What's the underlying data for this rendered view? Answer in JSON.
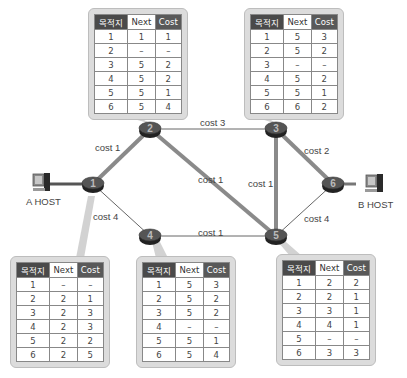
{
  "routers": [
    {
      "id": "1",
      "x": 93,
      "y": 184
    },
    {
      "id": "2",
      "x": 150,
      "y": 129
    },
    {
      "id": "3",
      "x": 276,
      "y": 129
    },
    {
      "id": "4",
      "x": 150,
      "y": 236
    },
    {
      "id": "5",
      "x": 276,
      "y": 236
    },
    {
      "id": "6",
      "x": 333,
      "y": 184
    }
  ],
  "links": [
    {
      "from": "1",
      "to": "2",
      "label": "cost 1",
      "thick": true
    },
    {
      "from": "1",
      "to": "4",
      "label": "cost 4",
      "thick": false
    },
    {
      "from": "2",
      "to": "3",
      "label": "cost 3",
      "thick": false
    },
    {
      "from": "2",
      "to": "5",
      "label": "cost 1",
      "thick": true
    },
    {
      "from": "3",
      "to": "5",
      "label": "cost 1",
      "thick": true
    },
    {
      "from": "3",
      "to": "6",
      "label": "cost 2",
      "thick": true
    },
    {
      "from": "4",
      "to": "5",
      "label": "cost 1",
      "thick": false
    },
    {
      "from": "5",
      "to": "6",
      "label": "cost 4",
      "thick": false
    }
  ],
  "hosts": {
    "a": {
      "label": "A HOST"
    },
    "b": {
      "label": "B HOST"
    }
  },
  "table_headers": {
    "dest": "목적지",
    "next": "Next",
    "cost": "Cost"
  },
  "tables": {
    "r1": {
      "rows": [
        [
          "1",
          "–",
          "–"
        ],
        [
          "2",
          "2",
          "1"
        ],
        [
          "3",
          "2",
          "3"
        ],
        [
          "4",
          "2",
          "3"
        ],
        [
          "5",
          "2",
          "2"
        ],
        [
          "6",
          "2",
          "5"
        ]
      ]
    },
    "r2": {
      "rows": [
        [
          "1",
          "1",
          "1"
        ],
        [
          "2",
          "–",
          "–"
        ],
        [
          "3",
          "5",
          "2"
        ],
        [
          "4",
          "5",
          "2"
        ],
        [
          "5",
          "5",
          "1"
        ],
        [
          "6",
          "5",
          "4"
        ]
      ]
    },
    "r3": {
      "rows": [
        [
          "1",
          "5",
          "3"
        ],
        [
          "2",
          "5",
          "2"
        ],
        [
          "3",
          "–",
          "–"
        ],
        [
          "4",
          "5",
          "2"
        ],
        [
          "5",
          "5",
          "1"
        ],
        [
          "6",
          "6",
          "2"
        ]
      ]
    },
    "r4": {
      "rows": [
        [
          "1",
          "5",
          "3"
        ],
        [
          "2",
          "5",
          "2"
        ],
        [
          "3",
          "5",
          "2"
        ],
        [
          "4",
          "–",
          "–"
        ],
        [
          "5",
          "5",
          "1"
        ],
        [
          "6",
          "5",
          "4"
        ]
      ]
    },
    "r5": {
      "rows": [
        [
          "1",
          "2",
          "2"
        ],
        [
          "2",
          "2",
          "1"
        ],
        [
          "3",
          "3",
          "1"
        ],
        [
          "4",
          "4",
          "1"
        ],
        [
          "5",
          "–",
          "–"
        ],
        [
          "6",
          "3",
          "3"
        ]
      ]
    }
  },
  "colors": {
    "thick_link": "#8a8a8a",
    "thin_link": "#666666",
    "router_body": "#3a3a3a",
    "table_bg": "#dcdcdc"
  }
}
